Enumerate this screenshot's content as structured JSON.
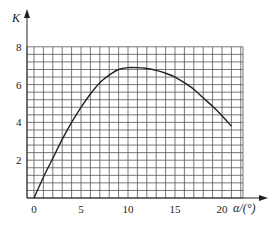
{
  "chart_data": {
    "type": "line",
    "title": "",
    "xlabel": "α/(°)",
    "ylabel": "K",
    "xlim": [
      0,
      22.5
    ],
    "ylim": [
      0,
      8
    ],
    "grid": true,
    "x_ticks": [
      "0",
      "5",
      "10",
      "15",
      "20"
    ],
    "y_ticks": [
      "2",
      "4",
      "6",
      "8"
    ],
    "series": [
      {
        "name": "K",
        "x": [
          0,
          1,
          2,
          3,
          4,
          5,
          6,
          7,
          8,
          9,
          10,
          11,
          12,
          13,
          14,
          15,
          16,
          17,
          18,
          19,
          20,
          21
        ],
        "values": [
          0,
          1.1,
          2.1,
          3.1,
          4.0,
          4.8,
          5.5,
          6.1,
          6.5,
          6.8,
          6.9,
          6.9,
          6.85,
          6.75,
          6.6,
          6.4,
          6.1,
          5.75,
          5.3,
          4.85,
          4.35,
          3.8
        ]
      }
    ]
  },
  "labels": {
    "y_axis": "K",
    "x_axis": "α/(°)"
  }
}
